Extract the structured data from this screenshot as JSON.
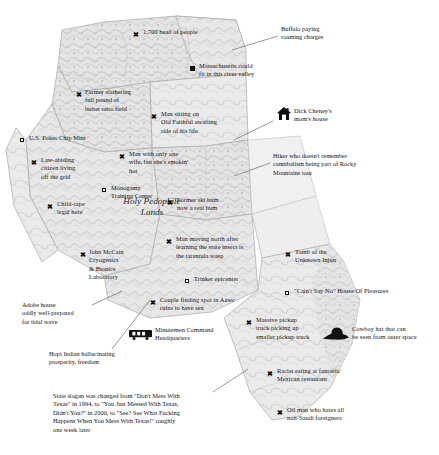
{
  "map": {
    "title": "Satirical map of the American West",
    "region_labels": [
      {
        "name": "holy-pedophile-lands",
        "text": "Holy Pedophile\nLands",
        "x": 104,
        "y": 196,
        "w": 96
      }
    ],
    "colors": {
      "land_light": "#e9e9e9",
      "land_mid": "#d2d2d2",
      "land_dark": "#bcbcbc",
      "border": "#a9a9a9",
      "text": "#141414",
      "marker": "#111111",
      "leader": "#555555",
      "background": "#ffffff"
    }
  },
  "markers": [
    {
      "id": "head-of-people",
      "type": "x",
      "mx": 133,
      "my": 32,
      "lx": 143,
      "ly": 28,
      "text": "1,700 head of people",
      "align": "left"
    },
    {
      "id": "massachusetts-river-valley",
      "type": "square-filled",
      "mx": 190,
      "my": 66,
      "lx": 199,
      "ly": 62,
      "text": "Massachusetts could\nfit in this river valley",
      "align": "left"
    },
    {
      "id": "farmer-slathering-butter",
      "type": "x",
      "mx": 76,
      "my": 92,
      "lx": 85,
      "ly": 88,
      "text": "Farmer slathering\nfull pound of\nbutter onto field",
      "align": "left"
    },
    {
      "id": "man-old-faithful",
      "type": "x",
      "mx": 151,
      "my": 114,
      "lx": 161,
      "ly": 110,
      "text": "Man sitting on\nOld Faithful awaiting\nride of his life",
      "align": "left"
    },
    {
      "id": "poker-chip-mint",
      "type": "square-hollow",
      "mx": 20,
      "my": 138,
      "lx": 29,
      "ly": 134,
      "text": "U.S. Poker Chip Mint",
      "align": "left"
    },
    {
      "id": "law-abiding-citizen",
      "type": "x",
      "mx": 31,
      "my": 160,
      "lx": 41,
      "ly": 156,
      "text": "Law-abiding\ncitizen living\noff the grid",
      "align": "left"
    },
    {
      "id": "man-only-one-wife",
      "type": "x",
      "mx": 119,
      "my": 154,
      "lx": 129,
      "ly": 150,
      "text": "Man with only one\nwife, but she's smokin'\nhot",
      "align": "left"
    },
    {
      "id": "monogamy-training-center",
      "type": "square-hollow",
      "mx": 102,
      "my": 188,
      "lx": 111,
      "ly": 184,
      "text": "Monogamy\nTraining Center",
      "align": "left"
    },
    {
      "id": "child-rape-legal",
      "type": "x",
      "mx": 47,
      "my": 204,
      "lx": 57,
      "ly": 200,
      "text": "Child-rape\nlegal here",
      "align": "left"
    },
    {
      "id": "former-ski-bum",
      "type": "x",
      "mx": 167,
      "my": 200,
      "lx": 177,
      "ly": 196,
      "text": "Former ski bum\nnow a real bum",
      "align": "left"
    },
    {
      "id": "man-moving-north",
      "type": "x",
      "mx": 166,
      "my": 239,
      "lx": 176,
      "ly": 235,
      "text": "Man moving north after\nlearning the state insect is\nthe tarantula wasp",
      "align": "left"
    },
    {
      "id": "john-mccain-cryogenics",
      "type": "x",
      "mx": 80,
      "my": 252,
      "lx": 89,
      "ly": 248,
      "text": "John McCain\nCryogenics\n& Bionics\nLaboratory",
      "align": "left"
    },
    {
      "id": "tomb-unknown-injun",
      "type": "x",
      "mx": 285,
      "my": 252,
      "lx": 295,
      "ly": 248,
      "text": "Tomb of the\nUnknown Injun",
      "align": "left"
    },
    {
      "id": "trinket-epicenter",
      "type": "square-hollow",
      "mx": 185,
      "my": 279,
      "lx": 194,
      "ly": 275,
      "text": "Trinket epicenter",
      "align": "left"
    },
    {
      "id": "caint-say-no",
      "type": "square-hollow",
      "mx": 285,
      "my": 291,
      "lx": 294,
      "ly": 287,
      "text": "\"Cain't Say No\" House Of Pleasures",
      "align": "left"
    },
    {
      "id": "couple-aztec-ruins",
      "type": "x",
      "mx": 150,
      "my": 300,
      "lx": 160,
      "ly": 296,
      "text": "Couple finding spot in Aztec\nruins to have sex",
      "align": "left"
    },
    {
      "id": "massive-pickup-truck",
      "type": "x",
      "mx": 246,
      "my": 320,
      "lx": 256,
      "ly": 316,
      "text": "Massive pickup\ntruck picking up\nsmaller pickup truck",
      "align": "left"
    },
    {
      "id": "racist-mexican-restaurant",
      "type": "x",
      "mx": 267,
      "my": 371,
      "lx": 277,
      "ly": 367,
      "text": "Racist eating at fantastic\nMexican restaurant",
      "align": "left"
    },
    {
      "id": "oil-man-non-saudi",
      "type": "x",
      "mx": 277,
      "my": 410,
      "lx": 287,
      "ly": 406,
      "text": "Oil man who hates all\nnon-Saudi foreigners",
      "align": "left"
    }
  ],
  "icons": [
    {
      "id": "dick-cheney-house",
      "icon": "house-icon",
      "mx": 276,
      "my": 110,
      "lx": 292,
      "ly": 110,
      "text": "Dick Cheney's\nmom's house"
    },
    {
      "id": "minutemen-hq",
      "icon": "missile-launcher-icon",
      "mx": 130,
      "my": 330,
      "lx": 152,
      "ly": 329,
      "text": "Minutemen Command\nHeadquarters"
    },
    {
      "id": "cowboy-hat",
      "icon": "cowboy-hat-icon",
      "mx": 325,
      "my": 330,
      "lx": 354,
      "ly": 328,
      "text": "Cowboy hat that can\nbe seen from outer space"
    }
  ],
  "callouts": [
    {
      "id": "buffalo-roaming-charges",
      "text": "Buffalo paying\nroaming charges",
      "x": 281,
      "y": 25,
      "lead": {
        "x1": 278,
        "y1": 36,
        "x2": 232,
        "y2": 50
      }
    },
    {
      "id": "hiker-cannibalism",
      "text": "Hiker who doesn't remember\ncannibalism being part of Rocky\nMountains tour",
      "x": 273,
      "y": 152,
      "lead": {
        "x1": 270,
        "y1": 163,
        "x2": 234,
        "y2": 176
      }
    },
    {
      "id": "adobe-house-tidal-wave",
      "text": "Adobe house\noddly well-prepared\nfor tidal wave",
      "x": 22,
      "y": 301,
      "lead": {
        "x1": 92,
        "y1": 305,
        "x2": 120,
        "y2": 292
      }
    },
    {
      "id": "hopi-indian-hallucinating",
      "text": "Hopi Indian hallucinating\nprosperity, freedom",
      "x": 49,
      "y": 350,
      "lead": {
        "x1": 112,
        "y1": 349,
        "x2": 150,
        "y2": 300
      }
    },
    {
      "id": "texas-state-slogan",
      "text": "State slogan was changed from \"Don't Mess With\nTexas\" in 1994, to \"You Just Messed With Texas,\nDidn't You?\" in 2000, to \"See? See What Fucking\nHappens When You Mess With Texas!\" roughly\none week later",
      "x": 53,
      "y": 392,
      "lead": {
        "x1": 213,
        "y1": 392,
        "x2": 246,
        "y2": 371
      }
    }
  ]
}
